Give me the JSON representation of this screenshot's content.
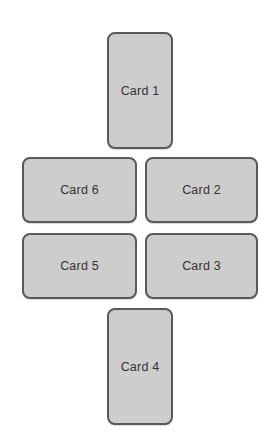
{
  "diagram": {
    "cards": [
      {
        "id": "card1",
        "label": "Card 1",
        "position": "top"
      },
      {
        "id": "card2",
        "label": "Card 2",
        "position": "middle-upper-right"
      },
      {
        "id": "card3",
        "label": "Card 3",
        "position": "middle-lower-right"
      },
      {
        "id": "card4",
        "label": "Card 4",
        "position": "bottom"
      },
      {
        "id": "card5",
        "label": "Card 5",
        "position": "middle-lower-left"
      },
      {
        "id": "card6",
        "label": "Card 6",
        "position": "middle-upper-left"
      }
    ],
    "colors": {
      "card_fill": "#cdcdcd",
      "card_border": "#5a5a5a",
      "text": "#333333",
      "background": "#ffffff"
    }
  }
}
